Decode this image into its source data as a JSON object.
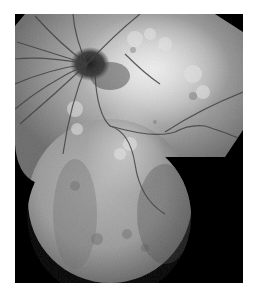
{
  "figure": {
    "kind": "fundus-autofluorescence-montage",
    "background_color": "#ffffff",
    "frame_color": "#000000",
    "features": [
      {
        "name": "optic-disc",
        "description": "dark hypo-autofluorescent area near upper-left center"
      },
      {
        "name": "retinal-vessels",
        "description": "dark branching vessel lines radiating from disc"
      },
      {
        "name": "hyperautofluorescent-ring",
        "description": "bright mottled patches around macula, upper right"
      },
      {
        "name": "lower-field",
        "description": "circular lower montage field with diffuse gray signal"
      }
    ]
  }
}
